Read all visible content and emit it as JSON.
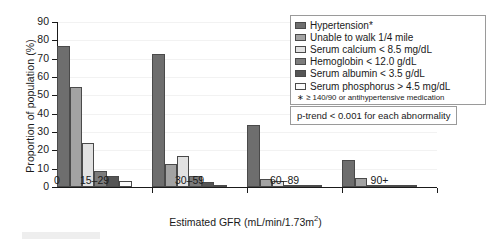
{
  "chart_data": {
    "type": "bar",
    "title": "",
    "xlabel": "Estimated GFR (mL/min/1.73m2)",
    "xlabel_main": "Estimated GFR (mL/min/1.73m",
    "xlabel_sup": "2",
    "xlabel_tail": ")",
    "ylabel": "Proportion of population (%)",
    "ylim": [
      0,
      90
    ],
    "yticks": [
      0,
      10,
      20,
      30,
      40,
      50,
      60,
      70,
      80,
      90
    ],
    "grid": true,
    "legend_position": "top-right",
    "origin_tick_label": "0",
    "categories": [
      "15–29",
      "30–59",
      "60–89",
      "90+"
    ],
    "series": [
      {
        "name": "Hypertension*",
        "color": "#6e6e6e",
        "values": [
          77,
          72.5,
          34,
          15
        ]
      },
      {
        "name": "Unable to walk 1/4 mile",
        "color": "#a3a3a3",
        "values": [
          54.5,
          12.5,
          4.5,
          5
        ]
      },
      {
        "name": "Serum calcium  <  8.5 mg/dL",
        "color": "#e2e2e2",
        "values": [
          24,
          17,
          3.5,
          0.7
        ]
      },
      {
        "name": "Hemoglobin  <  12.0 g/dL",
        "color": "#7c7c7c",
        "values": [
          9,
          6,
          1,
          1
        ]
      },
      {
        "name": "Serum albumin  <  3.5 g/dL",
        "color": "#555555",
        "values": [
          6,
          2.5,
          1,
          1
        ]
      },
      {
        "name": "Serum phosphorus  >  4.5 mg/dL",
        "color": "#fbfbfb",
        "values": [
          3.5,
          0.5,
          0.3,
          0.2
        ]
      }
    ],
    "annotations": [
      "* ≥ 140/90 or antihypertensive medication",
      "p-trend  <  0.001 for each abnormality"
    ]
  },
  "legend": {
    "items": [
      {
        "label": "Hypertension*",
        "color": "#6e6e6e"
      },
      {
        "label": "Unable to walk 1/4 mile",
        "color": "#a3a3a3"
      },
      {
        "label": "Serum calcium  <  8.5 mg/dL",
        "color": "#e2e2e2"
      },
      {
        "label": "Hemoglobin  <  12.0 g/dL",
        "color": "#7c7c7c"
      },
      {
        "label": "Serum albumin  <  3.5 g/dL",
        "color": "#555555"
      },
      {
        "label": "Serum phosphorus  >  4.5 mg/dL",
        "color": "#fbfbfb"
      }
    ],
    "footnote": "∗ ≥ 140/90 or antihypertensive medication"
  },
  "ptrend": {
    "text": "p-trend  <  0.001 for each abnormality"
  }
}
